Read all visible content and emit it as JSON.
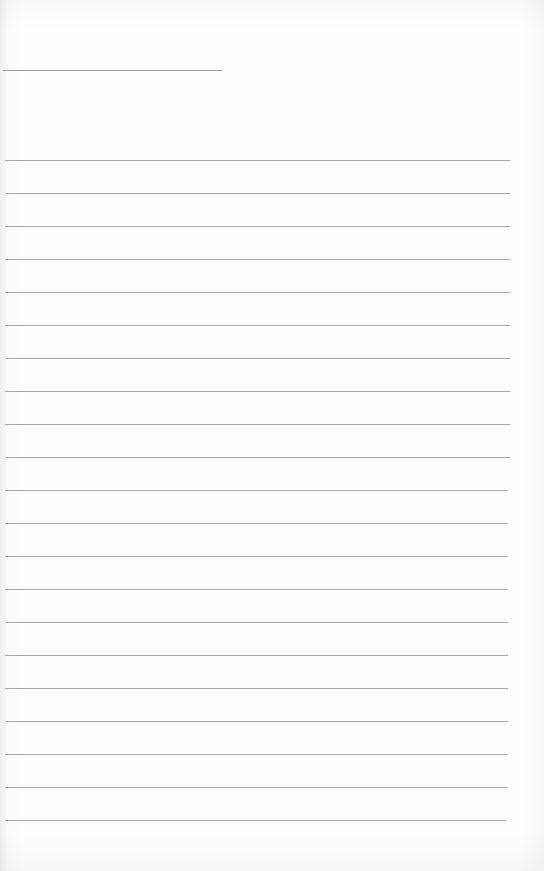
{
  "page": {
    "type": "lined blank writing page",
    "background_color": "#fdfdfd",
    "line_color": "#a8a8a8",
    "title_line": {
      "x": 3,
      "y": 70,
      "width": 219
    },
    "ruled_lines": {
      "count": 21,
      "first_y": 160,
      "spacing": 33,
      "x_start": 5,
      "x_end": 510
    },
    "text": ""
  }
}
